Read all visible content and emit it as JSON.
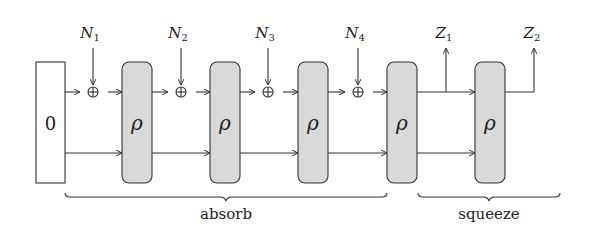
{
  "diagram": {
    "type": "sponge-construction",
    "colors": {
      "line": "#333333",
      "permutation_fill": "#d9d9d9",
      "background": "#ffffff"
    },
    "initial_state": {
      "label": "0"
    },
    "inputs": [
      {
        "label": "N",
        "sub": "1"
      },
      {
        "label": "N",
        "sub": "2"
      },
      {
        "label": "N",
        "sub": "3"
      },
      {
        "label": "N",
        "sub": "4"
      }
    ],
    "xor_symbol": "⊕",
    "permutations": [
      {
        "label": "ρ"
      },
      {
        "label": "ρ"
      },
      {
        "label": "ρ"
      },
      {
        "label": "ρ"
      },
      {
        "label": "ρ"
      }
    ],
    "outputs": [
      {
        "label": "Z",
        "sub": "1"
      },
      {
        "label": "Z",
        "sub": "2"
      }
    ],
    "phases": [
      {
        "label": "absorb"
      },
      {
        "label": "squeeze"
      }
    ]
  }
}
